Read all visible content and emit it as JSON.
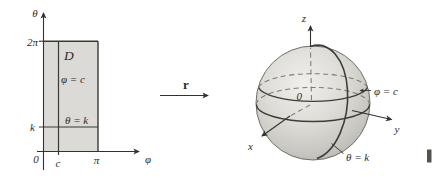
{
  "figure": {
    "domain_plot": {
      "y_axis_label": "θ",
      "x_axis_label": "φ",
      "y_tick_top": "2π",
      "y_tick_k": "k",
      "origin_label": "0",
      "x_tick_c": "c",
      "x_tick_pi": "π",
      "region_label": "D",
      "phi_line_label": "φ = c",
      "theta_line_label": "θ = k"
    },
    "map_arrow": {
      "label": "r"
    },
    "sphere_plot": {
      "z_axis_label": "z",
      "x_axis_label": "x",
      "y_axis_label": "y",
      "origin_label": "0",
      "phi_curve_label": "φ = c",
      "theta_curve_label": "θ = k"
    },
    "colors": {
      "region_fill": "#dbdad6",
      "line": "#34322f",
      "sphere_edge": "#70706a"
    }
  }
}
